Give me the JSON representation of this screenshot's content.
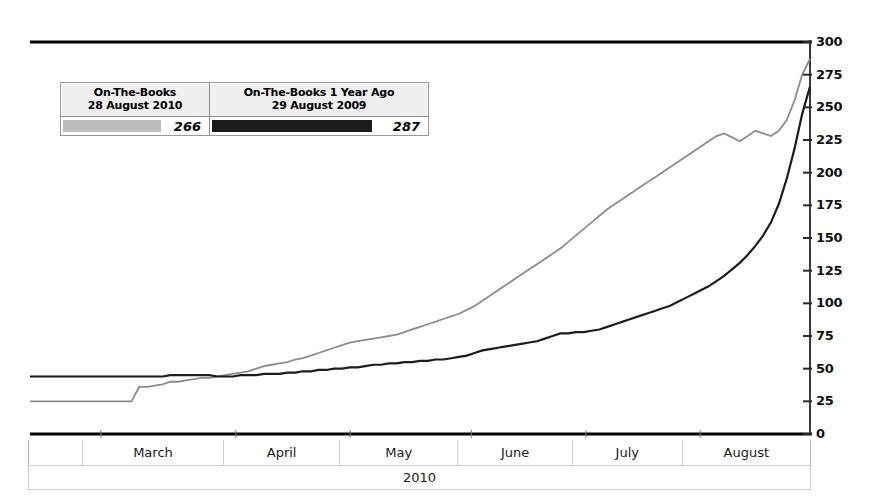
{
  "legend": {
    "series": [
      {
        "title_line1": "On-The-Books",
        "title_line2": "28 August 2010",
        "value": "266",
        "swatch": "light-gray-bar",
        "color": "#bdbdbd"
      },
      {
        "title_line1": "On-The-Books 1 Year Ago",
        "title_line2": "29 August 2009",
        "value": "287",
        "swatch": "dark-bar",
        "color": "#1c1c1c"
      }
    ]
  },
  "axis": {
    "year_label": "2010",
    "month_labels": [
      "",
      "March",
      "April",
      "May",
      "June",
      "July",
      "August"
    ],
    "y_ticks": [
      "300",
      "275",
      "250",
      "225",
      "200",
      "175",
      "150",
      "125",
      "100",
      "75",
      "50",
      "25",
      "0"
    ]
  },
  "chart_data": {
    "type": "line",
    "title": "",
    "subtitle": "",
    "xlabel": "2010",
    "ylabel": "",
    "ylim": [
      0,
      300
    ],
    "yticks": [
      0,
      25,
      50,
      75,
      100,
      125,
      150,
      175,
      200,
      225,
      250,
      275,
      300
    ],
    "grid": false,
    "legend_position": "top-left",
    "x_categories": [
      "",
      "March",
      "April",
      "May",
      "June",
      "July",
      "August"
    ],
    "x_note": "Booking date axis spanning late February through 28 August 2010; monthly bands shown.",
    "series": [
      {
        "name": "On-The-Books 28 August 2010",
        "color": "#1c1c1c",
        "final_value": 266,
        "x": [
          0,
          1,
          2,
          3,
          4,
          5,
          6,
          7,
          8,
          9,
          10,
          11,
          12,
          13,
          14,
          15,
          16,
          17,
          18,
          19,
          20,
          21,
          22,
          23,
          24,
          25,
          26,
          27,
          28,
          29,
          30,
          31,
          32,
          33,
          34,
          35,
          36,
          37,
          38,
          39,
          40,
          41,
          42,
          43,
          44,
          45,
          46,
          47,
          48,
          49,
          50,
          51,
          52,
          53,
          54,
          55,
          56,
          57,
          58,
          59,
          60,
          61,
          62,
          63,
          64,
          65,
          66,
          67,
          68,
          69,
          70,
          71,
          72,
          73,
          74,
          75,
          76,
          77,
          78,
          79,
          80,
          81,
          82,
          83,
          84,
          85,
          86,
          87,
          88,
          89,
          90,
          91,
          92,
          93,
          94,
          95,
          96,
          97,
          98,
          99,
          100
        ],
        "values": [
          44,
          44,
          44,
          44,
          44,
          44,
          44,
          44,
          44,
          44,
          44,
          44,
          44,
          44,
          44,
          44,
          44,
          44,
          45,
          45,
          45,
          45,
          45,
          45,
          44,
          44,
          44,
          45,
          45,
          45,
          46,
          46,
          46,
          47,
          47,
          48,
          48,
          49,
          49,
          50,
          50,
          51,
          51,
          52,
          53,
          53,
          54,
          54,
          55,
          55,
          56,
          56,
          57,
          57,
          58,
          59,
          60,
          62,
          64,
          65,
          66,
          67,
          68,
          69,
          70,
          71,
          73,
          75,
          77,
          77,
          78,
          78,
          79,
          80,
          82,
          84,
          86,
          88,
          90,
          92,
          94,
          96,
          98,
          101,
          104,
          107,
          110,
          113,
          117,
          121,
          126,
          131,
          137,
          144,
          152,
          162,
          176,
          195,
          218,
          245,
          266
        ]
      },
      {
        "name": "On-The-Books 1 Year Ago (29 August 2009)",
        "color": "#8c8c8c",
        "final_value": 287,
        "x": [
          0,
          1,
          2,
          3,
          4,
          5,
          6,
          7,
          8,
          9,
          10,
          11,
          12,
          13,
          14,
          15,
          16,
          17,
          18,
          19,
          20,
          21,
          22,
          23,
          24,
          25,
          26,
          27,
          28,
          29,
          30,
          31,
          32,
          33,
          34,
          35,
          36,
          37,
          38,
          39,
          40,
          41,
          42,
          43,
          44,
          45,
          46,
          47,
          48,
          49,
          50,
          51,
          52,
          53,
          54,
          55,
          56,
          57,
          58,
          59,
          60,
          61,
          62,
          63,
          64,
          65,
          66,
          67,
          68,
          69,
          70,
          71,
          72,
          73,
          74,
          75,
          76,
          77,
          78,
          79,
          80,
          81,
          82,
          83,
          84,
          85,
          86,
          87,
          88,
          89,
          90,
          91,
          92,
          93,
          94,
          95,
          96,
          97,
          98,
          99,
          100
        ],
        "values": [
          25,
          25,
          25,
          25,
          25,
          25,
          25,
          25,
          25,
          25,
          25,
          25,
          25,
          25,
          36,
          36,
          37,
          38,
          40,
          40,
          41,
          42,
          43,
          43,
          44,
          45,
          46,
          47,
          48,
          50,
          52,
          53,
          54,
          55,
          57,
          58,
          60,
          62,
          64,
          66,
          68,
          70,
          71,
          72,
          73,
          74,
          75,
          76,
          78,
          80,
          82,
          84,
          86,
          88,
          90,
          92,
          95,
          98,
          102,
          106,
          110,
          114,
          118,
          122,
          126,
          130,
          134,
          138,
          142,
          147,
          152,
          157,
          162,
          167,
          172,
          176,
          180,
          184,
          188,
          192,
          196,
          200,
          204,
          208,
          212,
          216,
          220,
          224,
          228,
          230,
          227,
          224,
          228,
          232,
          230,
          228,
          232,
          240,
          255,
          275,
          287
        ]
      }
    ],
    "annotations": [
      {
        "text": "Both series converge near the right edge of the plot",
        "type": "note"
      }
    ]
  }
}
